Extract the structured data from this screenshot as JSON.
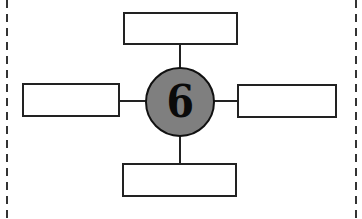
{
  "diagram": {
    "type": "spider-map",
    "center": {
      "label": "6",
      "fill": "#7f7f7f"
    },
    "boxes": [
      {
        "position": "top",
        "text": ""
      },
      {
        "position": "left",
        "text": ""
      },
      {
        "position": "right",
        "text": ""
      },
      {
        "position": "bottom",
        "text": ""
      }
    ],
    "border": "dashed",
    "stroke": "#222222"
  }
}
